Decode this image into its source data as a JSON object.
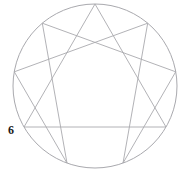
{
  "figure": {
    "name": "enneagram",
    "background_color": "#ffffff",
    "line_color": "#a9a9ae",
    "label_color": "#1b1b1b"
  },
  "circle": {
    "name": "outer-circle",
    "center_x": 95,
    "center_y": 86,
    "radius": 82,
    "stroke": "#a9a9ae",
    "stroke_width": 1.0
  },
  "points": [
    {
      "number": "1",
      "angle_deg": -50,
      "x": 147.7,
      "y": 23.2,
      "visible_label": false
    },
    {
      "number": "2",
      "angle_deg": -10,
      "x": 175.7,
      "y": 71.8,
      "visible_label": false
    },
    {
      "number": "3",
      "angle_deg": 30,
      "x": 166.0,
      "y": 127.0,
      "visible_label": false
    },
    {
      "number": "4",
      "angle_deg": 70,
      "x": 123.0,
      "y": 163.1,
      "visible_label": false
    },
    {
      "number": "5",
      "angle_deg": 110,
      "x": 67.0,
      "y": 163.1,
      "visible_label": false
    },
    {
      "number": "6",
      "angle_deg": 150,
      "x": 24.0,
      "y": 127.0,
      "visible_label": true
    },
    {
      "number": "7",
      "angle_deg": 190,
      "x": 14.3,
      "y": 71.8,
      "visible_label": false
    },
    {
      "number": "8",
      "angle_deg": 230,
      "x": 42.3,
      "y": 23.2,
      "visible_label": false
    },
    {
      "number": "9",
      "angle_deg": 270,
      "x": 95.0,
      "y": 4.0,
      "visible_label": false
    }
  ],
  "labels": {
    "point_six": "6"
  },
  "paths": {
    "triangle": "M 95,4 L 166,127 L 24,127 Z",
    "hexad": "M 147.7,23.2 L 123,163.1 L 175.7,71.8 L 42.3,23.2 L 67,163.1 L 14.3,71.8 Z"
  },
  "path_sequences": {
    "triangle_points": [
      "9",
      "3",
      "6"
    ],
    "hexad_points": [
      "1",
      "4",
      "2",
      "8",
      "5",
      "7"
    ]
  }
}
